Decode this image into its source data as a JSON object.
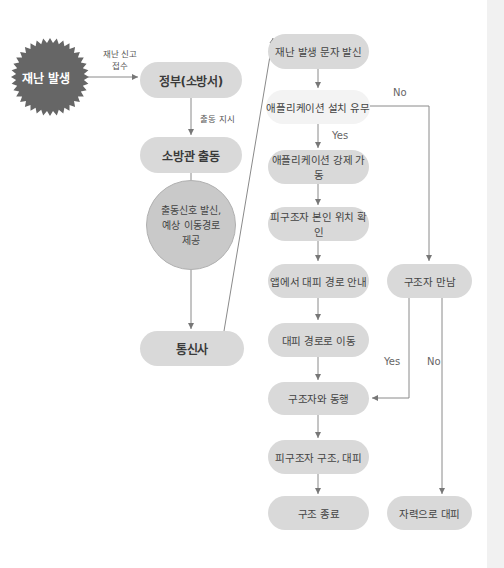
{
  "start": {
    "label": "재난 발생",
    "shape": "starburst",
    "color": "#666666"
  },
  "edge_labels": {
    "report": "재난 신고\n접수",
    "dispatch_order": "출동 지시",
    "no_app": "No",
    "yes_app": "Yes",
    "met_yes": "Yes",
    "met_no": "No"
  },
  "left_column": {
    "gov": "정부(소방서)",
    "firefighter": "소방관 출동",
    "signal": "출동신호 발신,\n예상 이동경로\n제공",
    "telecom": "통신사"
  },
  "center_column": [
    "재난 발생 문자 발신",
    "애플리케이션 설치 유무",
    "애플리케이션 강제 가동",
    "피구조자 본인 위치 확인",
    "앱에서 대피 경로 안내",
    "대피 경로로 이동",
    "구조자와 동행",
    "피구조자 구조, 대피",
    "구조 종료"
  ],
  "right_column": {
    "meet_rescuer": "구조자 만남",
    "self_evacuate": "자력으로 대피"
  },
  "colors": {
    "box": "#d9d9d9",
    "decision_box": "#f3f3f3",
    "line": "#888888",
    "starburst": "#666666"
  }
}
